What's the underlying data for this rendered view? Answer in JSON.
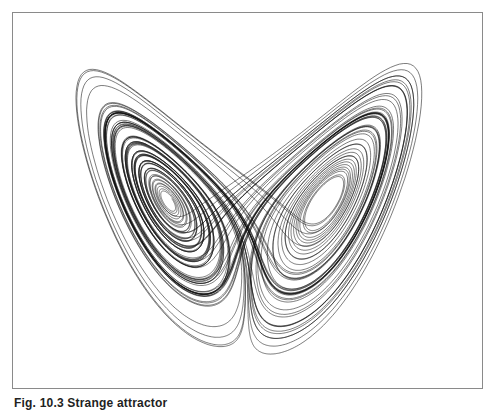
{
  "figure": {
    "caption": "Fig. 10.3 Strange attractor",
    "frame_color": "#8a8a8a",
    "line_color": "#111111",
    "background": "#ffffff"
  },
  "attractor": {
    "type": "lorenz",
    "sigma": 10,
    "rho": 28,
    "beta": 2.6667,
    "dt": 0.004,
    "steps": 22000,
    "projection": "x-z",
    "description": "Butterfly-shaped strange attractor with two lobes and white 'eye' centers"
  }
}
